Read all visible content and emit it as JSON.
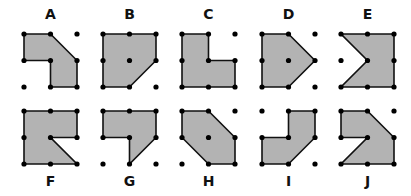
{
  "figure": {
    "fill_color": "#b3b3b3",
    "stroke_color": "#111111",
    "dot_color": "#000000",
    "grid_spacing": 26.5
  },
  "shapes": [
    {
      "label": "A",
      "row": 0,
      "col": 0,
      "polygon": [
        [
          0,
          0
        ],
        [
          1,
          0
        ],
        [
          2,
          1
        ],
        [
          2,
          2
        ],
        [
          1,
          2
        ],
        [
          1,
          1
        ],
        [
          0,
          1
        ]
      ]
    },
    {
      "label": "B",
      "row": 0,
      "col": 1,
      "polygon": [
        [
          0,
          0
        ],
        [
          1,
          0
        ],
        [
          2,
          0
        ],
        [
          2,
          1
        ],
        [
          1,
          2
        ],
        [
          0,
          2
        ]
      ]
    },
    {
      "label": "C",
      "row": 0,
      "col": 2,
      "polygon": [
        [
          0,
          0
        ],
        [
          1,
          0
        ],
        [
          1,
          1
        ],
        [
          2,
          1
        ],
        [
          2,
          2
        ],
        [
          0,
          2
        ]
      ]
    },
    {
      "label": "D",
      "row": 0,
      "col": 3,
      "polygon": [
        [
          0,
          0
        ],
        [
          1,
          0
        ],
        [
          2,
          1
        ],
        [
          1,
          2
        ],
        [
          0,
          2
        ]
      ]
    },
    {
      "label": "E",
      "row": 0,
      "col": 4,
      "polygon": [
        [
          0,
          0
        ],
        [
          2,
          0
        ],
        [
          2,
          2
        ],
        [
          0,
          2
        ],
        [
          1,
          1
        ]
      ]
    },
    {
      "label": "F",
      "row": 1,
      "col": 0,
      "polygon": [
        [
          0,
          0
        ],
        [
          2,
          0
        ],
        [
          2,
          1
        ],
        [
          1,
          1
        ],
        [
          2,
          2
        ],
        [
          0,
          2
        ]
      ]
    },
    {
      "label": "G",
      "row": 1,
      "col": 1,
      "polygon": [
        [
          0,
          0
        ],
        [
          2,
          0
        ],
        [
          2,
          1
        ],
        [
          1,
          2
        ],
        [
          1,
          1
        ],
        [
          0,
          1
        ]
      ]
    },
    {
      "label": "H",
      "row": 1,
      "col": 2,
      "polygon": [
        [
          0,
          0
        ],
        [
          1,
          0
        ],
        [
          2,
          1
        ],
        [
          2,
          2
        ],
        [
          1,
          2
        ],
        [
          0,
          1
        ]
      ]
    },
    {
      "label": "I",
      "row": 1,
      "col": 3,
      "polygon": [
        [
          1,
          0
        ],
        [
          2,
          0
        ],
        [
          2,
          1
        ],
        [
          1,
          2
        ],
        [
          0,
          2
        ],
        [
          0,
          1
        ],
        [
          1,
          1
        ]
      ]
    },
    {
      "label": "J",
      "row": 1,
      "col": 4,
      "polygon": [
        [
          0,
          0
        ],
        [
          1,
          0
        ],
        [
          2,
          1
        ],
        [
          2,
          2
        ],
        [
          0,
          2
        ],
        [
          1,
          1
        ],
        [
          0,
          1
        ]
      ]
    }
  ]
}
